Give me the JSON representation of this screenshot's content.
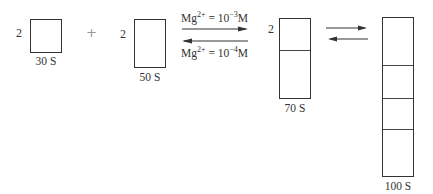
{
  "diagram": {
    "reactants": [
      {
        "coefficient": "2",
        "label": "30 S",
        "segments": 1
      },
      {
        "coefficient": "2",
        "label": "50 S",
        "segments": 1
      }
    ],
    "plus_sign": "+",
    "condition_forward": {
      "ion": "Mg",
      "charge": "2+",
      "equals": " = 10",
      "exponent": "−3",
      "unit": "M"
    },
    "condition_reverse": {
      "ion": "Mg",
      "charge": "2+",
      "equals": " = 10",
      "exponent": "−4",
      "unit": "M"
    },
    "intermediate": {
      "coefficient": "2",
      "label": "70 S",
      "segments": 2
    },
    "product": {
      "label": "100 S",
      "segments": 4
    },
    "arrows": [
      {
        "direction": "forward"
      },
      {
        "direction": "reverse"
      }
    ]
  }
}
